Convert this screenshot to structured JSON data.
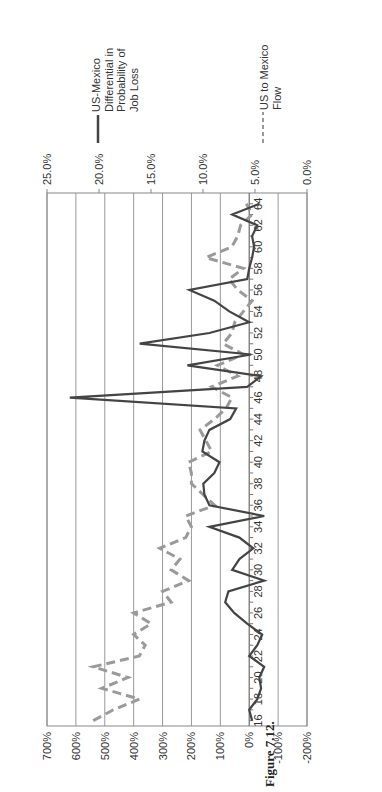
{
  "figure": {
    "caption": "Figure 7.12."
  },
  "chart_data": {
    "type": "line",
    "orientation": "rotated-90-ccw",
    "title": "",
    "xlabel": "",
    "ylabel": "",
    "x": [
      16,
      17,
      18,
      19,
      20,
      21,
      22,
      23,
      24,
      25,
      26,
      27,
      28,
      29,
      30,
      31,
      32,
      33,
      34,
      35,
      36,
      37,
      38,
      39,
      40,
      41,
      42,
      43,
      44,
      45,
      46,
      47,
      48,
      49,
      50,
      51,
      52,
      53,
      54,
      55,
      56,
      57,
      58,
      59,
      60,
      61,
      62,
      63,
      64
    ],
    "x_tick_labels": [
      "16",
      "18",
      "20",
      "22",
      "24",
      "26",
      "28",
      "30",
      "32",
      "34",
      "36",
      "38",
      "40",
      "42",
      "44",
      "46",
      "48",
      "50",
      "52",
      "54",
      "56",
      "58",
      "60",
      "62",
      "64"
    ],
    "left_axis": {
      "ticks": [
        "-200%",
        "-100%",
        "0%",
        "100%",
        "200%",
        "300%",
        "400%",
        "500%",
        "600%",
        "700%"
      ],
      "ylim": [
        -200,
        700
      ]
    },
    "right_axis": {
      "ticks": [
        "0.0%",
        "5.0%",
        "10.0%",
        "15.0%",
        "20.0%",
        "25.0%"
      ],
      "ylim": [
        0,
        25
      ]
    },
    "grid": true,
    "legend_position": "right",
    "series": [
      {
        "name": "US-Mexico Differential in Probability of Job Loss",
        "style": "solid",
        "color": "#444444",
        "axis": "left",
        "values": [
          -10,
          0,
          -28,
          -41,
          -35,
          -52,
          0,
          -28,
          -45,
          7,
          52,
          83,
          72,
          -52,
          59,
          34,
          -14,
          34,
          138,
          -52,
          138,
          155,
          159,
          121,
          103,
          162,
          155,
          138,
          66,
          45,
          621,
          7,
          -41,
          214,
          -7,
          379,
          138,
          0,
          69,
          121,
          207,
          7,
          0,
          -10,
          -17,
          -10,
          -28,
          59,
          -35
        ]
      },
      {
        "name": "US to Mexico Flow",
        "style": "dashed",
        "color": "#999999",
        "axis": "left",
        "values": [
          540,
          470,
          380,
          510,
          420,
          540,
          380,
          360,
          400,
          340,
          400,
          270,
          300,
          210,
          270,
          240,
          310,
          220,
          200,
          220,
          120,
          160,
          200,
          200,
          210,
          130,
          150,
          170,
          120,
          80,
          60,
          130,
          40,
          110,
          20,
          90,
          60,
          50,
          20,
          -10,
          40,
          70,
          20,
          150,
          60,
          40,
          30,
          -10,
          10
        ]
      }
    ]
  },
  "legend": {
    "items": [
      {
        "label_lines": [
          "US-Mexico",
          "Differential in",
          "Probability of",
          "Job Loss"
        ]
      },
      {
        "label_lines": [
          "US to Mexico",
          "Flow"
        ]
      }
    ]
  }
}
